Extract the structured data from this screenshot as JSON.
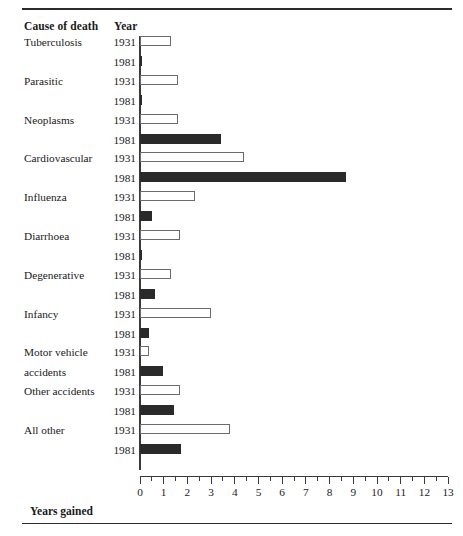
{
  "figure": {
    "column_headers": {
      "cause": "Cause of death",
      "year": "Year"
    },
    "axis_title": "Years gained"
  },
  "chart_data": {
    "type": "bar",
    "orientation": "horizontal",
    "title": "",
    "xlabel": "Years gained",
    "ylabel": "Cause of death",
    "xlim": [
      0,
      13
    ],
    "xticks": [
      0,
      1,
      2,
      3,
      4,
      5,
      6,
      7,
      8,
      9,
      10,
      11,
      12,
      13
    ],
    "xtick_labels": [
      "0",
      "1",
      "2",
      "3",
      "4",
      "5",
      "6",
      "7",
      "8",
      "9",
      "10",
      "11",
      "12",
      "13"
    ],
    "minor_tick_interval": 0.5,
    "grid": false,
    "legend": null,
    "categories": [
      "Tuberculosis",
      "Parasitic",
      "Neoplasms",
      "Cardiovascular",
      "Influenza",
      "Diarrhoea",
      "Degenerative",
      "Infancy",
      "Motor vehicle accidents",
      "Other accidents",
      "All other"
    ],
    "series": [
      {
        "name": "1931",
        "style": "open",
        "values": [
          1.3,
          1.6,
          1.6,
          4.4,
          2.3,
          1.7,
          1.3,
          3.0,
          0.4,
          1.7,
          3.8
        ]
      },
      {
        "name": "1981",
        "style": "filled",
        "values": [
          0.05,
          0.08,
          3.4,
          8.7,
          0.5,
          0.05,
          0.65,
          0.4,
          0.95,
          1.45,
          1.75
        ]
      }
    ],
    "groups": [
      {
        "cause": "Tuberculosis",
        "label_lines": [
          "Tuberculosis"
        ],
        "rows": [
          {
            "year": "1931",
            "value": 1.3,
            "style": "open"
          },
          {
            "year": "1981",
            "value": 0.05,
            "style": "filled"
          }
        ]
      },
      {
        "cause": "Parasitic",
        "label_lines": [
          "Parasitic"
        ],
        "rows": [
          {
            "year": "1931",
            "value": 1.6,
            "style": "open"
          },
          {
            "year": "1981",
            "value": 0.08,
            "style": "filled"
          }
        ]
      },
      {
        "cause": "Neoplasms",
        "label_lines": [
          "Neoplasms"
        ],
        "rows": [
          {
            "year": "1931",
            "value": 1.6,
            "style": "open"
          },
          {
            "year": "1981",
            "value": 3.4,
            "style": "filled"
          }
        ]
      },
      {
        "cause": "Cardiovascular",
        "label_lines": [
          "Cardiovascular"
        ],
        "rows": [
          {
            "year": "1931",
            "value": 4.4,
            "style": "open"
          },
          {
            "year": "1981",
            "value": 8.7,
            "style": "filled"
          }
        ]
      },
      {
        "cause": "Influenza",
        "label_lines": [
          "Influenza"
        ],
        "rows": [
          {
            "year": "1931",
            "value": 2.3,
            "style": "open"
          },
          {
            "year": "1981",
            "value": 0.5,
            "style": "filled"
          }
        ]
      },
      {
        "cause": "Diarrhoea",
        "label_lines": [
          "Diarrhoea"
        ],
        "rows": [
          {
            "year": "1931",
            "value": 1.7,
            "style": "open"
          },
          {
            "year": "1981",
            "value": 0.05,
            "style": "filled"
          }
        ]
      },
      {
        "cause": "Degenerative",
        "label_lines": [
          "Degenerative"
        ],
        "rows": [
          {
            "year": "1931",
            "value": 1.3,
            "style": "open"
          },
          {
            "year": "1981",
            "value": 0.65,
            "style": "filled"
          }
        ]
      },
      {
        "cause": "Infancy",
        "label_lines": [
          "Infancy"
        ],
        "rows": [
          {
            "year": "1931",
            "value": 3.0,
            "style": "open"
          },
          {
            "year": "1981",
            "value": 0.4,
            "style": "filled"
          }
        ]
      },
      {
        "cause": "Motor vehicle accidents",
        "label_lines": [
          "Motor vehicle",
          "accidents"
        ],
        "rows": [
          {
            "year": "1931",
            "value": 0.4,
            "style": "open"
          },
          {
            "year": "1981",
            "value": 0.95,
            "style": "filled"
          }
        ]
      },
      {
        "cause": "Other accidents",
        "label_lines": [
          "Other accidents"
        ],
        "rows": [
          {
            "year": "1931",
            "value": 1.7,
            "style": "open"
          },
          {
            "year": "1981",
            "value": 1.45,
            "style": "filled"
          }
        ]
      },
      {
        "cause": "All other",
        "label_lines": [
          "All other"
        ],
        "rows": [
          {
            "year": "1931",
            "value": 3.8,
            "style": "open"
          },
          {
            "year": "1981",
            "value": 1.75,
            "style": "filled"
          }
        ]
      }
    ]
  },
  "colors": {
    "bar_open_fill": "#ffffff",
    "bar_open_border": "#6b6b6b",
    "bar_filled": "#2a2a2a",
    "rule": "#2b2b2b",
    "text": "#1a1a1a"
  }
}
